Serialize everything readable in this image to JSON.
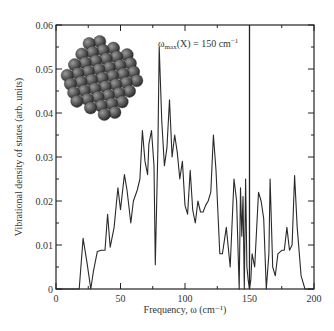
{
  "chart_data": {
    "type": "line",
    "title": "",
    "xlabel": "Frequency, ω (cm⁻¹)",
    "ylabel": "Vibrational density of states (arb. units)",
    "xlim": [
      0,
      200
    ],
    "ylim": [
      0,
      0.06
    ],
    "xticks": [
      0,
      50,
      100,
      150,
      200
    ],
    "xtick_labels": [
      "0",
      "50",
      "100",
      "150",
      "200"
    ],
    "yticks": [
      0,
      0.01,
      0.02,
      0.03,
      0.04,
      0.05,
      0.06
    ],
    "ytick_labels": [
      "0",
      "0.01",
      "0.02",
      "0.03",
      "0.04",
      "0.05",
      "0.06"
    ],
    "grid": false,
    "legend": null,
    "annotations": [
      {
        "text_main": "ω",
        "text_sub": "max",
        "text_rest": "(X) = 150 cm",
        "text_sup": "−1",
        "x": 150,
        "type": "vertical-line"
      }
    ],
    "inset": "nanoparticle-cluster-image",
    "series": [
      {
        "name": "VDOS",
        "x": [
          0,
          18,
          21,
          24,
          27,
          29,
          32,
          35,
          38,
          40,
          42,
          45,
          48,
          50,
          53,
          55,
          58,
          60,
          63,
          65,
          67,
          69,
          71,
          72,
          74,
          76,
          77,
          79,
          80,
          82,
          84,
          86,
          88,
          90,
          92,
          94,
          96,
          98,
          100,
          102,
          104,
          106,
          108,
          110,
          112,
          114,
          116,
          118,
          120,
          122,
          124,
          127,
          129,
          132,
          135,
          138,
          140,
          142,
          143,
          144,
          145,
          146,
          147,
          148,
          149,
          150,
          151,
          152,
          154,
          157,
          159,
          161,
          163,
          165,
          166,
          168,
          170,
          172,
          175,
          177,
          179,
          181,
          183,
          185,
          187,
          190,
          193,
          196,
          200
        ],
        "y": [
          0,
          0,
          0.0115,
          0.006,
          0,
          0.004,
          0.0085,
          0.0088,
          0.0088,
          0.017,
          0.0095,
          0.014,
          0.023,
          0.018,
          0.026,
          0.0225,
          0.015,
          0.02,
          0.0225,
          0.025,
          0.036,
          0.029,
          0.026,
          0.033,
          0.036,
          0.028,
          0.0055,
          0.032,
          0.055,
          0.038,
          0.028,
          0.032,
          0.043,
          0.03,
          0.035,
          0.031,
          0.025,
          0.029,
          0.019,
          0.017,
          0.027,
          0.018,
          0.015,
          0.02,
          0.0175,
          0.0175,
          0.019,
          0.02,
          0.022,
          0.035,
          0.027,
          0.008,
          0.008,
          0.014,
          0.005,
          0.025,
          0.02,
          0.0,
          0.023,
          0.012,
          0.021,
          0.0,
          0.025,
          0.005,
          0.002,
          0.0,
          0.002,
          0.008,
          0.005,
          0.022,
          0.02,
          0.016,
          0.0,
          0.008,
          0.025,
          0.005,
          0.003,
          0.008,
          0.0088,
          0.0088,
          0.014,
          0.0088,
          0.01,
          0.0258,
          0.014,
          0.003,
          0.0,
          0.0,
          0.0
        ]
      }
    ]
  }
}
